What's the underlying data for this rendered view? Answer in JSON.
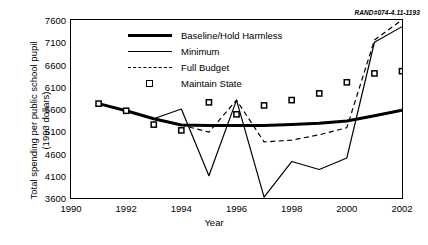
{
  "figure": {
    "rand_id": "RAND#074-4.11-1193",
    "xlabel": "Year",
    "ylabel_line1": "Total spending per public school pupil",
    "ylabel_line2": "(1993 dollars)"
  },
  "legend": [
    {
      "label": "Baseline/Hold Harmless",
      "key": "thick-line"
    },
    {
      "label": "Minimum",
      "key": "thin-line"
    },
    {
      "label": "Full Budget",
      "key": "dashed-line"
    },
    {
      "label": "Maintain State",
      "key": "square-marker"
    }
  ],
  "chart_data": {
    "type": "line",
    "title": "",
    "xlabel": "Year",
    "ylabel": "Total spending per public school pupil (1993 dollars)",
    "xlim": [
      1990,
      2002
    ],
    "ylim": [
      3600,
      7600
    ],
    "xticks": [
      1990,
      1992,
      1994,
      1996,
      1998,
      2000,
      2002
    ],
    "yticks": [
      3600,
      4100,
      4600,
      5100,
      5600,
      6100,
      6600,
      7100,
      7600
    ],
    "grid": false,
    "legend_position": "upper-left-inside",
    "series": [
      {
        "name": "Baseline/Hold Harmless",
        "style": "thick-solid",
        "x": [
          1991,
          1992,
          1993,
          1994,
          1995,
          1996,
          1997,
          1998,
          1999,
          2000,
          2001,
          2002
        ],
        "values": [
          5720,
          5560,
          5380,
          5240,
          5230,
          5230,
          5230,
          5250,
          5280,
          5330,
          5450,
          5570
        ]
      },
      {
        "name": "Minimum",
        "style": "thin-solid",
        "x": [
          1991,
          1992,
          1993,
          1994,
          1995,
          1996,
          1997,
          1998,
          1999,
          2000,
          2001,
          2002
        ],
        "values": [
          5720,
          5560,
          5380,
          5600,
          4100,
          5800,
          3620,
          4420,
          4240,
          4500,
          7100,
          7450
        ]
      },
      {
        "name": "Full Budget",
        "style": "dashed",
        "x": [
          1991,
          1992,
          1993,
          1994,
          1995,
          1996,
          1997,
          1998,
          1999,
          2000,
          2001,
          2002
        ],
        "values": [
          5720,
          5560,
          5380,
          5240,
          5080,
          5800,
          4860,
          4900,
          5020,
          5180,
          7150,
          7600
        ]
      },
      {
        "name": "Maintain State",
        "style": "square-markers-only",
        "x": [
          1991,
          1992,
          1993,
          1994,
          1995,
          1996,
          1997,
          1998,
          1999,
          2000,
          2001,
          2002
        ],
        "values": [
          5720,
          5560,
          5250,
          5120,
          5750,
          5480,
          5680,
          5800,
          5950,
          6200,
          6400,
          6450
        ]
      }
    ]
  }
}
